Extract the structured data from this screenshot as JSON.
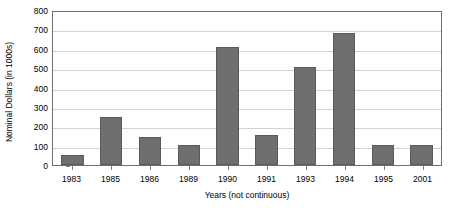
{
  "chart_data": {
    "type": "bar",
    "title": "",
    "xlabel": "Years (not continuous)",
    "ylabel": "Nominal Dollars (in 1000s)",
    "categories": [
      "1983",
      "1985",
      "1986",
      "1989",
      "1990",
      "1991",
      "1993",
      "1994",
      "1995",
      "2001"
    ],
    "values": [
      50,
      250,
      145,
      105,
      610,
      155,
      505,
      680,
      105,
      105
    ],
    "ylim": [
      0,
      800
    ],
    "ytick_step": 100,
    "yticks": [
      0,
      100,
      200,
      300,
      400,
      500,
      600,
      700,
      800
    ],
    "ytick_labels": [
      "0",
      "100",
      "200",
      "300",
      "400",
      "500",
      "600",
      "700",
      "800"
    ],
    "grid": true,
    "grid_axis": "y",
    "legend": false,
    "bar_color": "#706f6f",
    "bar_edge_color": "#5a5a5a",
    "gridline_color": "#d3d3d3",
    "axis_color": "#6f6f6f",
    "background_color": "#ffffff",
    "series": [
      {
        "name": "Nominal Dollars",
        "values": [
          50,
          250,
          145,
          105,
          610,
          155,
          505,
          680,
          105,
          105
        ]
      }
    ]
  }
}
